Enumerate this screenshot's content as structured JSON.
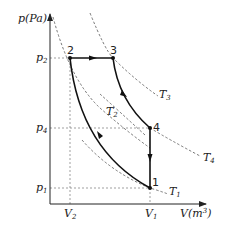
{
  "diagram": {
    "axes": {
      "y_label": "p(Pa)",
      "x_label": "V(m³)",
      "y_label_p": "p",
      "y_label_unit": "(Pa)",
      "x_label_v": "V",
      "x_label_unit": "(m",
      "x_label_exp": "3",
      "x_label_close": ")"
    },
    "y_ticks": [
      {
        "base": "p",
        "sub": "2"
      },
      {
        "base": "p",
        "sub": "4"
      },
      {
        "base": "p",
        "sub": "1"
      }
    ],
    "x_ticks": [
      {
        "base": "V",
        "sub": "2"
      },
      {
        "base": "V",
        "sub": "1"
      }
    ],
    "points": [
      {
        "label": "1"
      },
      {
        "label": "2"
      },
      {
        "label": "3"
      },
      {
        "label": "4"
      }
    ],
    "isotherms": [
      {
        "base": "T",
        "sub": "1"
      },
      {
        "base": "T",
        "sub": "2"
      },
      {
        "base": "T",
        "sub": "3"
      },
      {
        "base": "T",
        "sub": "4"
      }
    ],
    "processes": [
      {
        "from": "1",
        "to": "2",
        "type": "curve"
      },
      {
        "from": "2",
        "to": "3",
        "type": "isobaric"
      },
      {
        "from": "3",
        "to": "4",
        "type": "curve"
      },
      {
        "from": "4",
        "to": "1",
        "type": "isochoric"
      }
    ],
    "colors": {
      "line": "#222222",
      "dashed": "#555555",
      "background": "#ffffff"
    }
  }
}
